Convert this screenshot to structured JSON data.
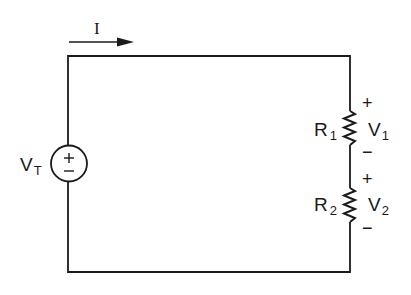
{
  "diagram": {
    "type": "series-circuit",
    "colors": {
      "ink": "#1a1a1a",
      "background": "#ffffff"
    },
    "current": {
      "label": "I",
      "direction": "right-arrow-icon"
    },
    "source": {
      "label_main": "V",
      "label_sub": "T",
      "plus": "+",
      "minus": "−",
      "icon": "voltage-source-icon"
    },
    "resistors": [
      {
        "label_main": "R",
        "label_sub": "1",
        "voltage_main": "V",
        "voltage_sub": "1",
        "plus": "+",
        "minus": "−"
      },
      {
        "label_main": "R",
        "label_sub": "2",
        "voltage_main": "V",
        "voltage_sub": "2",
        "plus": "+",
        "minus": "−"
      }
    ]
  }
}
